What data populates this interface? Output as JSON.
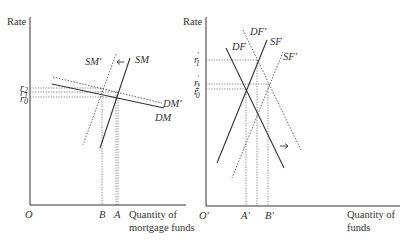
{
  "left_panel": {
    "y_axis_label": "Rate",
    "origin_label": "O",
    "x_axis_label_line1": "Quantity of",
    "x_axis_label_line2": "mortgage funds",
    "rate_ticks": [
      {
        "label": "r",
        "sub": "2",
        "prime": ""
      },
      {
        "label": "r",
        "sub": "1",
        "prime": ""
      },
      {
        "label": "r",
        "sub": "0",
        "prime": ""
      }
    ],
    "quantity_ticks": [
      "B",
      "A"
    ],
    "curves": {
      "demand": "DM",
      "demand_shifted": "DM′",
      "supply": "SM",
      "supply_shifted": "SM′"
    },
    "shift_arrow": "left"
  },
  "right_panel": {
    "y_axis_label": "Rate",
    "origin_label": "O′",
    "x_axis_label_line1": "Quantity of",
    "x_axis_label_line2": "funds",
    "rate_ticks": [
      {
        "label": "r",
        "sub": "1",
        "prime": "′"
      },
      {
        "label": "r",
        "sub": "2",
        "prime": "′"
      },
      {
        "label": "r",
        "sub": "0",
        "prime": "′"
      }
    ],
    "quantity_ticks": [
      "A′",
      "B′"
    ],
    "curves": {
      "demand": "DF",
      "demand_shifted": "DF′",
      "supply": "SF",
      "supply_shifted": "SF′"
    },
    "shift_arrow": "right"
  }
}
